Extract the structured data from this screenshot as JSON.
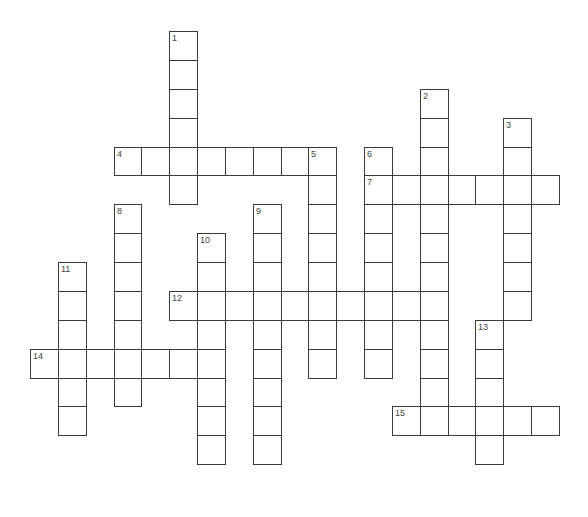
{
  "puzzle": {
    "type": "crossword",
    "grid": {
      "origin_x": 30,
      "origin_y": 31,
      "cell_w": 27.84,
      "cell_h": 28.88,
      "border_color": "#3a3a3a",
      "number_color": "#444444"
    },
    "words": [
      {
        "number": "1",
        "direction": "down",
        "row": 0,
        "col": 5,
        "length": 6
      },
      {
        "number": "2",
        "direction": "down",
        "row": 2,
        "col": 14,
        "length": 12
      },
      {
        "number": "3",
        "direction": "down",
        "row": 3,
        "col": 17,
        "length": 7
      },
      {
        "number": "4",
        "direction": "across",
        "row": 4,
        "col": 3,
        "length": 8
      },
      {
        "number": "5",
        "direction": "down",
        "row": 4,
        "col": 10,
        "length": 8
      },
      {
        "number": "6",
        "direction": "down",
        "row": 4,
        "col": 12,
        "length": 8
      },
      {
        "number": "7",
        "direction": "across",
        "row": 5,
        "col": 12,
        "length": 7
      },
      {
        "number": "8",
        "direction": "down",
        "row": 6,
        "col": 3,
        "length": 7
      },
      {
        "number": "9",
        "direction": "down",
        "row": 6,
        "col": 8,
        "length": 9
      },
      {
        "number": "10",
        "direction": "down",
        "row": 7,
        "col": 6,
        "length": 8
      },
      {
        "number": "11",
        "direction": "down",
        "row": 8,
        "col": 1,
        "length": 6
      },
      {
        "number": "12",
        "direction": "across",
        "row": 9,
        "col": 5,
        "length": 10
      },
      {
        "number": "13",
        "direction": "down",
        "row": 10,
        "col": 16,
        "length": 5
      },
      {
        "number": "14",
        "direction": "across",
        "row": 11,
        "col": 0,
        "length": 7
      },
      {
        "number": "15",
        "direction": "across",
        "row": 13,
        "col": 13,
        "length": 6
      }
    ]
  }
}
